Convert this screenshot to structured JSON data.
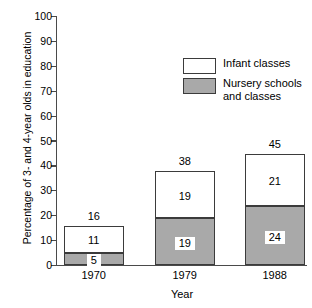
{
  "chart_data": {
    "type": "bar",
    "subtype": "stacked-bar",
    "title": "",
    "xlabel": "Year",
    "ylabel": "Percentage of 3- and 4-year olds in education",
    "categories": [
      "1970",
      "1979",
      "1988"
    ],
    "ylim": [
      0,
      100
    ],
    "ytick_values": [
      0,
      10,
      20,
      30,
      40,
      50,
      60,
      70,
      80,
      90,
      100
    ],
    "ytick_labels": [
      "0",
      "10",
      "20",
      "30",
      "40",
      "50",
      "60",
      "70",
      "80",
      "90",
      "100"
    ],
    "grid": false,
    "legend_position": "upper right",
    "series": [
      {
        "name": "Nursery schools and classes",
        "color": "#a9a9a9",
        "stack_order": 0,
        "values": [
          5,
          19,
          24
        ],
        "labels": [
          "5",
          "19",
          "24"
        ],
        "label_style": "boxed"
      },
      {
        "name": "Infant classes",
        "color": "#ffffff",
        "stack_order": 1,
        "values": [
          11,
          19,
          21
        ],
        "labels": [
          "11",
          "19",
          "21"
        ],
        "label_style": "plain"
      }
    ],
    "totals": [
      16,
      38,
      45
    ],
    "total_labels": [
      "16",
      "38",
      "45"
    ]
  },
  "legend": {
    "items": [
      {
        "label": "Infant classes",
        "swatch": "white"
      },
      {
        "label": "Nursery schools\nand classes",
        "swatch": "gray"
      }
    ]
  },
  "axes": {
    "y_title": "Percentage of 3- and 4-year olds in education",
    "x_title": "Year"
  }
}
